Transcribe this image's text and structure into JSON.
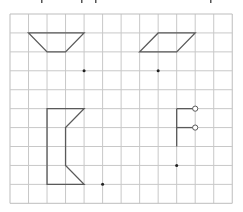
{
  "grid": {
    "origin_x": 10,
    "origin_y": 14,
    "cell_w": 18.52,
    "cell_h": 18.93,
    "cols": 12,
    "rows": 10,
    "line_color": "#c8c8c8",
    "border_color": "#bdbdbd"
  },
  "style": {
    "shape_color": "#5a5a5a",
    "dot_color": "#222222",
    "circle_fill": "#ffffff"
  },
  "top_fragments": [
    {
      "x": 41,
      "w": 1.5
    },
    {
      "x": 81,
      "w": 1.5
    },
    {
      "x": 95,
      "w": 1.5
    },
    {
      "x": 210,
      "w": 1.5
    }
  ],
  "shapes": [
    {
      "name": "trapezoid",
      "type": "polygon",
      "points_grid": [
        [
          1,
          1
        ],
        [
          4,
          1
        ],
        [
          3,
          2
        ],
        [
          2,
          2
        ]
      ]
    },
    {
      "name": "parallelogram",
      "type": "polygon",
      "points_grid": [
        [
          8,
          1
        ],
        [
          10,
          1
        ],
        [
          9,
          2
        ],
        [
          7,
          2
        ]
      ]
    },
    {
      "name": "notched-bracket-shape",
      "type": "polygon",
      "points_grid": [
        [
          2,
          5
        ],
        [
          4,
          5
        ],
        [
          3,
          6
        ],
        [
          3,
          8
        ],
        [
          4,
          9
        ],
        [
          2,
          9
        ]
      ]
    },
    {
      "name": "flag-figure",
      "type": "polyline-set",
      "lines_grid": [
        [
          [
            9,
            5
          ],
          [
            9,
            7
          ]
        ],
        [
          [
            9,
            5
          ],
          [
            10,
            5
          ]
        ],
        [
          [
            9,
            6
          ],
          [
            10,
            6
          ]
        ]
      ],
      "open_circles_grid": [
        [
          10,
          5
        ],
        [
          10,
          6
        ]
      ]
    }
  ],
  "dots": [
    {
      "name": "trapezoid-center-dot",
      "grid": [
        4,
        3
      ]
    },
    {
      "name": "parallelogram-center-dot",
      "grid": [
        8,
        3
      ]
    },
    {
      "name": "bracket-center-dot",
      "grid": [
        5,
        9
      ]
    },
    {
      "name": "flag-center-dot",
      "grid": [
        9,
        8
      ]
    }
  ]
}
